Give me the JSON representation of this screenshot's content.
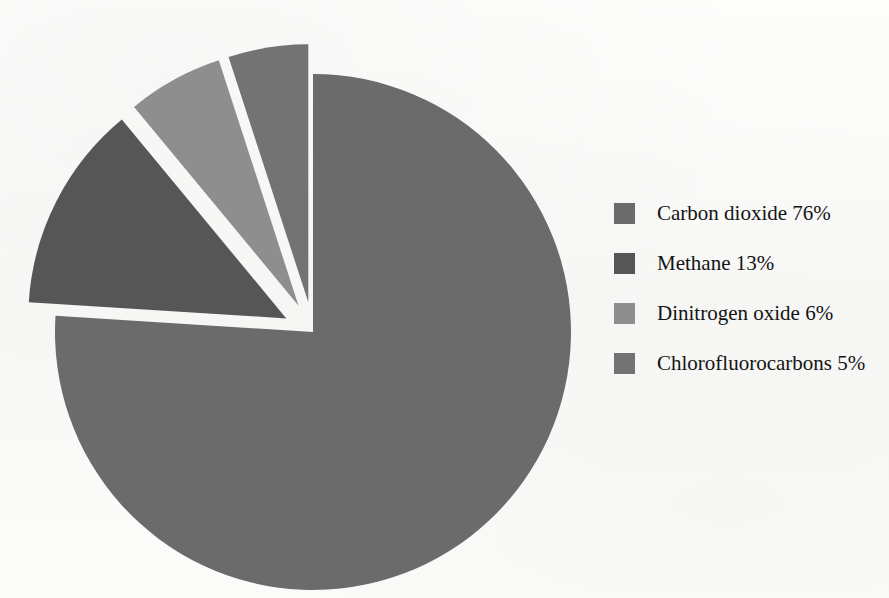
{
  "chart_data": {
    "type": "pie",
    "title": "",
    "subtitle": "",
    "xlabel": "",
    "ylabel": "",
    "legend_position": "right",
    "grid": false,
    "categories": [
      "Carbon dioxide",
      "Methane",
      "Dinitrogen oxide",
      "Chlorofluorocarbons"
    ],
    "values": [
      76,
      13,
      6,
      5
    ],
    "unit": "%",
    "slices": [
      {
        "label": "Carbon dioxide",
        "value": 76,
        "display": "Carbon dioxide 76%",
        "color": "#6b6b6b",
        "exploded": false
      },
      {
        "label": "Methane",
        "value": 13,
        "display": "Methane 13%",
        "color": "#565656",
        "exploded": true
      },
      {
        "label": "Dinitrogen oxide",
        "value": 6,
        "display": "Dinitrogen oxide 6%",
        "color": "#8e8e8e",
        "exploded": true
      },
      {
        "label": "Chlorofluorocarbons",
        "value": 5,
        "display": "Chlorofluorocarbons 5%",
        "color": "#737373",
        "exploded": true
      }
    ]
  },
  "legend": {
    "items": [
      {
        "text": "Carbon dioxide 76%",
        "color": "#6b6b6b"
      },
      {
        "text": "Methane 13%",
        "color": "#565656"
      },
      {
        "text": "Dinitrogen oxide 6%",
        "color": "#8e8e8e"
      },
      {
        "text": "Chlorofluorocarbons 5%",
        "color": "#737373"
      }
    ]
  },
  "background_artifacts": {
    "line1": "",
    "line2": "",
    "line3": ""
  }
}
